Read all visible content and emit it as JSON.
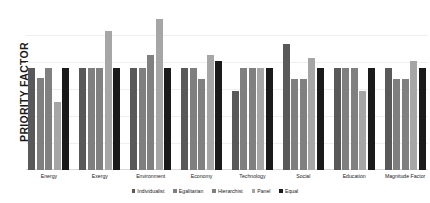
{
  "chart_data": {
    "type": "bar",
    "title": "",
    "xlabel": "",
    "ylabel": "PRIORITY FACTOR",
    "ylim": [
      0,
      1.0
    ],
    "grid": true,
    "legend_position": "bottom",
    "categories": [
      "Energy",
      "Exergy",
      "Environment",
      "Economy",
      "Technology",
      "Social",
      "Education",
      "Magnitude Factor"
    ],
    "series": [
      {
        "name": "Individualist",
        "color": "#595959",
        "values": [
          0.63,
          0.63,
          0.63,
          0.63,
          0.49,
          0.78,
          0.63,
          0.63
        ]
      },
      {
        "name": "Egalitarian",
        "color": "#7f7f7f",
        "values": [
          0.57,
          0.63,
          0.63,
          0.63,
          0.63,
          0.56,
          0.63,
          0.56
        ]
      },
      {
        "name": "Hierarchist",
        "color": "#808080",
        "values": [
          0.63,
          0.63,
          0.71,
          0.56,
          0.63,
          0.56,
          0.63,
          0.56
        ]
      },
      {
        "name": "Panel",
        "color": "#a6a6a6",
        "values": [
          0.42,
          0.86,
          0.93,
          0.71,
          0.63,
          0.69,
          0.49,
          0.67
        ]
      },
      {
        "name": "Equal",
        "color": "#1a1a1a",
        "values": [
          0.63,
          0.63,
          0.63,
          0.67,
          0.63,
          0.63,
          0.63,
          0.63
        ]
      }
    ]
  }
}
